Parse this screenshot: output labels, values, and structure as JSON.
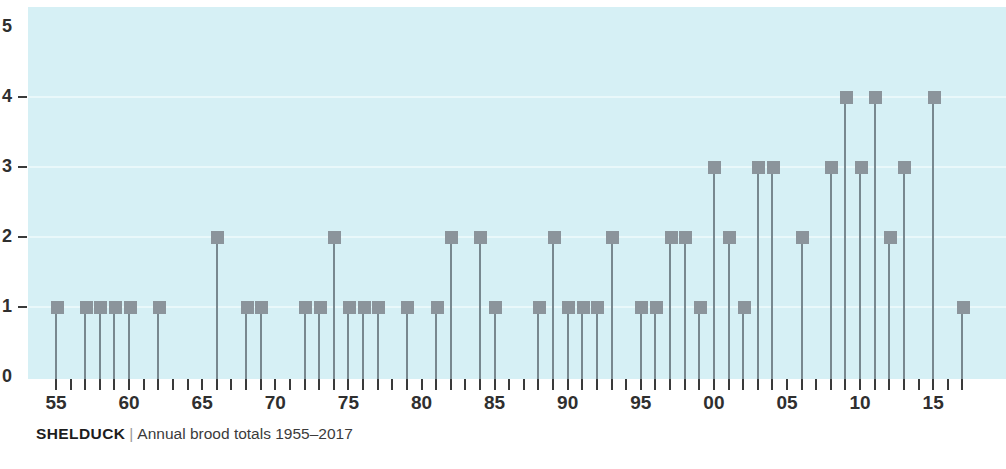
{
  "caption": {
    "species": "SHELDUCK",
    "separator": "|",
    "subtitle": "Annual brood totals 1955–2017"
  },
  "colors": {
    "plot_background": "#d6f0f5",
    "gridline": "#e9f8fa",
    "marker": "#8b949b",
    "stem": "#78888f",
    "axis_text": "#2f2f2f",
    "page_background": "#ffffff"
  },
  "chart_data": {
    "type": "bar",
    "xlabel": "",
    "ylabel": "",
    "ylim": [
      0,
      5
    ],
    "grid": true,
    "legend": null,
    "y_ticks": [
      0,
      1,
      2,
      3,
      4,
      5
    ],
    "y_tick_labels": [
      "0",
      "1",
      "2",
      "3",
      "4",
      "5"
    ],
    "x_tick_labels": [
      "55",
      "60",
      "65",
      "70",
      "75",
      "80",
      "85",
      "90",
      "95",
      "00",
      "05",
      "10",
      "15"
    ],
    "x_labelled_years": [
      1955,
      1960,
      1965,
      1970,
      1975,
      1980,
      1985,
      1990,
      1995,
      2000,
      2005,
      2010,
      2015
    ],
    "x_range": [
      1955,
      2017
    ],
    "categories": [
      "1955",
      "1956",
      "1957",
      "1958",
      "1959",
      "1960",
      "1961",
      "1962",
      "1963",
      "1964",
      "1965",
      "1966",
      "1967",
      "1968",
      "1969",
      "1970",
      "1971",
      "1972",
      "1973",
      "1974",
      "1975",
      "1976",
      "1977",
      "1978",
      "1979",
      "1980",
      "1981",
      "1982",
      "1983",
      "1984",
      "1985",
      "1986",
      "1987",
      "1988",
      "1989",
      "1990",
      "1991",
      "1992",
      "1993",
      "1994",
      "1995",
      "1996",
      "1997",
      "1998",
      "1999",
      "2000",
      "2001",
      "2002",
      "2003",
      "2004",
      "2005",
      "2006",
      "2007",
      "2008",
      "2009",
      "2010",
      "2011",
      "2012",
      "2013",
      "2014",
      "2015",
      "2016",
      "2017"
    ],
    "values": [
      1,
      0,
      1,
      1,
      1,
      1,
      0,
      1,
      0,
      0,
      0,
      2,
      0,
      1,
      1,
      0,
      0,
      1,
      1,
      2,
      1,
      1,
      1,
      0,
      1,
      0,
      1,
      2,
      0,
      2,
      1,
      0,
      0,
      1,
      2,
      1,
      1,
      1,
      2,
      0,
      1,
      1,
      2,
      2,
      1,
      3,
      2,
      1,
      3,
      3,
      0,
      2,
      0,
      3,
      4,
      3,
      4,
      2,
      3,
      0,
      4,
      0,
      1
    ]
  }
}
